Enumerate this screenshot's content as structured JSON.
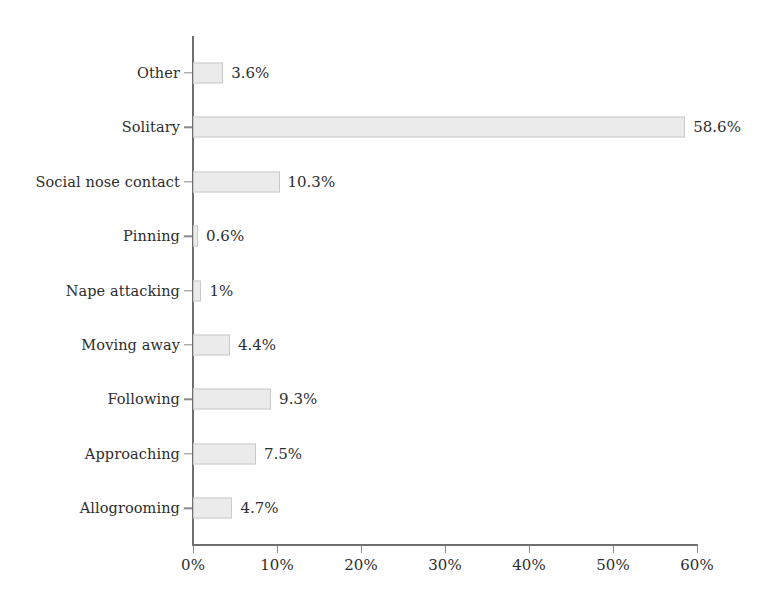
{
  "chart_data": {
    "type": "bar",
    "orientation": "horizontal",
    "title": "",
    "subtitle": "",
    "xlabel": "",
    "ylabel": "",
    "grid": false,
    "legend": false,
    "xlim": [
      0,
      60
    ],
    "categories": [
      "Other",
      "Solitary",
      "Social nose contact",
      "Pinning",
      "Nape attacking",
      "Moving away",
      "Following",
      "Approaching",
      "Allogrooming"
    ],
    "values": [
      3.6,
      58.6,
      10.3,
      0.6,
      1,
      4.4,
      9.3,
      7.5,
      4.7
    ],
    "value_labels": [
      "3.6%",
      "58.6%",
      "10.3%",
      "0.6%",
      "1%",
      "4.4%",
      "9.3%",
      "7.5%",
      "4.7%"
    ],
    "xticks": [
      0,
      10,
      20,
      30,
      40,
      50,
      60
    ],
    "xtick_labels": [
      "0%",
      "10%",
      "20%",
      "30%",
      "40%",
      "50%",
      "60%"
    ],
    "bar_fill": "#ebebeb",
    "bar_border": "#c9c9c9",
    "axis_color": "#6f6f6f",
    "text_color": "#2d2d2d",
    "background": "#ffffff"
  },
  "rows": [
    {
      "label": "Other",
      "value_label": "3.6%"
    },
    {
      "label": "Solitary",
      "value_label": "58.6%"
    },
    {
      "label": "Social nose contact",
      "value_label": "10.3%"
    },
    {
      "label": "Pinning",
      "value_label": "0.6%"
    },
    {
      "label": "Nape attacking",
      "value_label": "1%"
    },
    {
      "label": "Moving away",
      "value_label": "4.4%"
    },
    {
      "label": "Following",
      "value_label": "9.3%"
    },
    {
      "label": "Approaching",
      "value_label": "7.5%"
    },
    {
      "label": "Allogrooming",
      "value_label": "4.7%"
    }
  ],
  "xaxis": {
    "labels": [
      "0%",
      "10%",
      "20%",
      "30%",
      "40%",
      "50%",
      "60%"
    ]
  }
}
